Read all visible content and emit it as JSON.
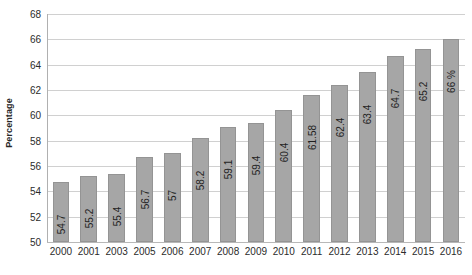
{
  "chart_data": {
    "type": "bar",
    "title": "",
    "xlabel": "",
    "ylabel": "Percentage",
    "ylim": [
      50,
      68
    ],
    "ytick_step": 2,
    "yticks": [
      68,
      66,
      64,
      62,
      60,
      58,
      56,
      54,
      52,
      50
    ],
    "grid": true,
    "legend": false,
    "bar_color": "#a6a6a6",
    "bar_edge_color": "#949494",
    "gridline_color": "#d0d0d0",
    "background": "#ffffff",
    "categories": [
      "2000",
      "2001",
      "2003",
      "2005",
      "2006",
      "2007",
      "2008",
      "2009",
      "2010",
      "2011",
      "2012",
      "2013",
      "2014",
      "2015",
      "2016"
    ],
    "values": [
      54.7,
      55.2,
      55.4,
      56.7,
      57,
      58.2,
      59.1,
      59.4,
      60.4,
      61.58,
      62.4,
      63.4,
      64.7,
      65.2,
      66
    ],
    "data_labels": [
      "54.7",
      "55.2",
      "55.4",
      "56.7",
      "57",
      "58.2",
      "59.1",
      "59.4",
      "60.4",
      "61.58",
      "62.4",
      "63.4",
      "64.7",
      "65.2",
      "66 %"
    ],
    "data_label_rotation": -90
  }
}
